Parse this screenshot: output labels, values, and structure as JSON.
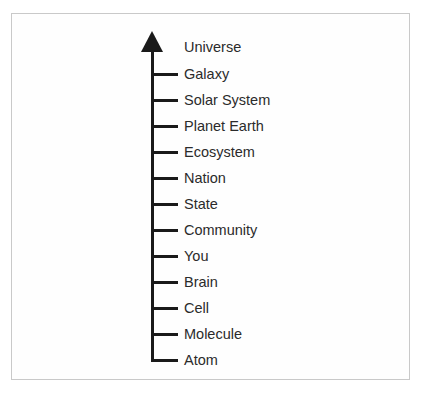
{
  "figure": {
    "axis_label": "scale-axis",
    "arrow_direction": "up",
    "arrowhead_icon": "arrow-up-icon",
    "border_color": "#c9c9c9",
    "line_color": "#1a1a1a",
    "text_color": "#2b2b2b",
    "background_color": "#fefefe"
  },
  "levels": [
    {
      "label": "Universe",
      "tick": false,
      "y": 47
    },
    {
      "label": "Galaxy",
      "tick": true,
      "y": 74
    },
    {
      "label": "Solar System",
      "tick": true,
      "y": 100
    },
    {
      "label": "Planet Earth",
      "tick": true,
      "y": 126
    },
    {
      "label": "Ecosystem",
      "tick": true,
      "y": 152
    },
    {
      "label": "Nation",
      "tick": true,
      "y": 178
    },
    {
      "label": "State",
      "tick": true,
      "y": 204
    },
    {
      "label": "Community",
      "tick": true,
      "y": 230
    },
    {
      "label": "You",
      "tick": true,
      "y": 256
    },
    {
      "label": "Brain",
      "tick": true,
      "y": 282
    },
    {
      "label": "Cell",
      "tick": true,
      "y": 308
    },
    {
      "label": "Molecule",
      "tick": true,
      "y": 334
    },
    {
      "label": "Atom",
      "tick": true,
      "y": 360
    }
  ]
}
